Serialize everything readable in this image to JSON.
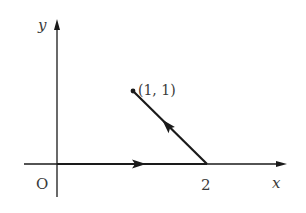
{
  "diagram": {
    "type": "coordinate-plane-vectors",
    "axes": {
      "x_label": "x",
      "y_label": "y",
      "origin_label": "O"
    },
    "tick_labels": {
      "x2": "2"
    },
    "points": {
      "p1": {
        "label": "(1, 1)",
        "x": 1,
        "y": 1
      }
    },
    "segments": [
      {
        "name": "origin-to-2",
        "from": [
          0,
          0
        ],
        "to": [
          2,
          0
        ],
        "direction": "right"
      },
      {
        "name": "2-to-1-1",
        "from": [
          2,
          0
        ],
        "to": [
          1,
          1
        ],
        "direction": "up-left"
      }
    ],
    "colors": {
      "line": "#1a1a1a",
      "text": "#3a3a3a"
    }
  }
}
